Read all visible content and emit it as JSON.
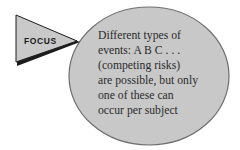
{
  "figure": {
    "name": "focus-callout-diagram",
    "background_color": "#ffffff"
  },
  "callout_tag": {
    "shape": "triangle-pointer-right",
    "label": "FOCUS",
    "fill_color": "#c9c9c9",
    "stroke_color": "#1c1c1c",
    "text_color": "#1a1a1a"
  },
  "balloon": {
    "shape": "ellipse",
    "fill_color": "#c8c8c8",
    "stroke_color": "#6e6e6e",
    "text_color": "#2b2b2b",
    "lines": [
      "Different types of",
      "events: A B C . . .",
      "(competing risks)",
      "are possible, but only",
      "one of these can",
      "occur per subject"
    ]
  }
}
